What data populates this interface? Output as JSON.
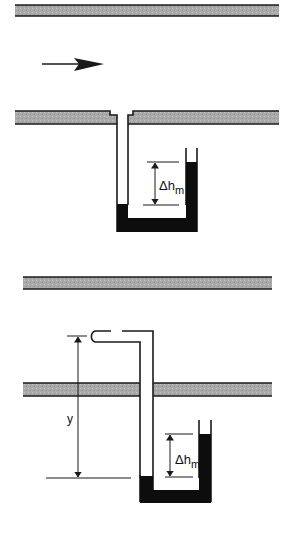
{
  "figure": {
    "colors": {
      "wall_fill": "#a8a8a8",
      "wall_edge": "#1a1a1a",
      "manometer_fluid": "#0d0d0d",
      "line": "#1a1a1a",
      "background": "#ffffff"
    }
  },
  "top_panel": {
    "name": "Wall static pressure tap",
    "flow_arrow": "flow direction right",
    "manometer_label": {
      "delta": "Δh",
      "subscript": "m"
    }
  },
  "bottom_panel": {
    "name": "Pitot tube",
    "height_label": "y",
    "manometer_label": {
      "delta": "Δh",
      "subscript": "m"
    }
  }
}
